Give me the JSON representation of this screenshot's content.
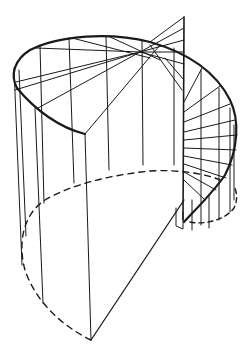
{
  "figure": {
    "stroke_color": "#1a1a1a",
    "background": "#ffffff",
    "elements": {
      "helix_rim": "heavy upper edge of helical stair stringer",
      "newel_post": "central vertical post",
      "treads": "radiating step lines",
      "balusters": "vertical lines on cylinder",
      "hidden_base": "dashed base ellipse",
      "cut_plane": "sectional front plane"
    }
  }
}
